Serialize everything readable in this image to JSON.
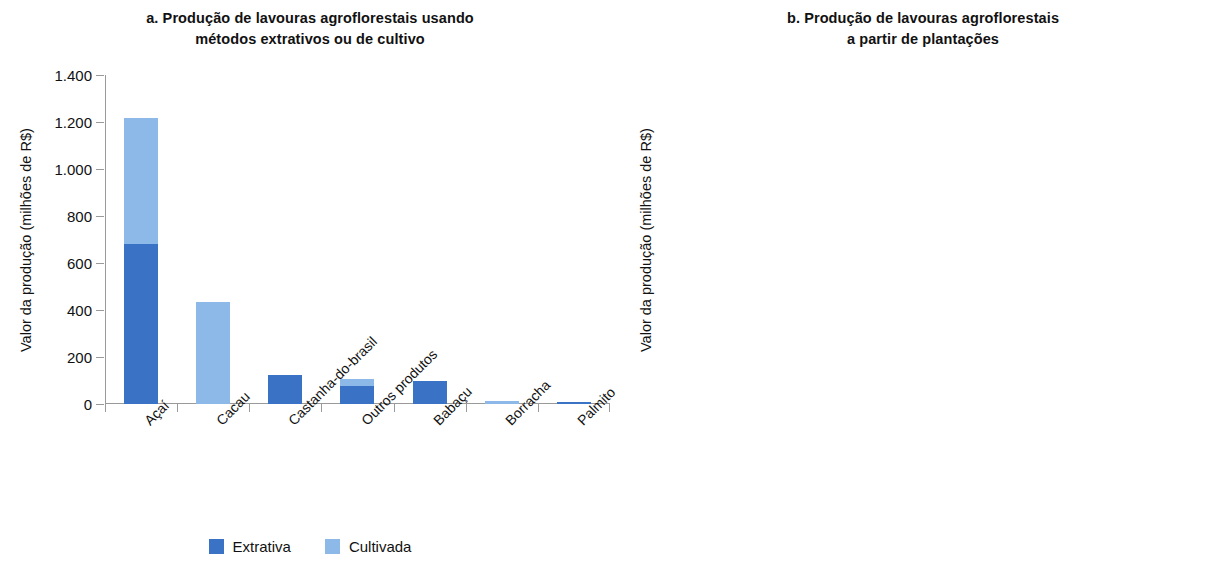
{
  "figure": {
    "legend": {
      "items": [
        {
          "label": "Extrativa",
          "color": "#3a73c5",
          "key": "extrativa"
        },
        {
          "label": "Cultivada",
          "color": "#8cb9e8",
          "key": "cultivada"
        }
      ]
    }
  },
  "panels": {
    "a": {
      "title": "a. Produção de lavouras agroflorestais usando métodos extrativos ou de cultivo",
      "title_line1": "a. Produção de lavouras agroflorestais usando",
      "title_line2": "métodos extrativos ou de cultivo",
      "ylabel": "Valor da produção (milhões de R$)"
    },
    "b": {
      "title": "b. Produção de lavouras agroflorestais a partir de plantações",
      "title_line1": "b. Produção de lavouras agroflorestais",
      "title_line2": "a partir de plantações",
      "ylabel": "Valor da produção (milhões de R$)"
    }
  },
  "chart_data": [
    {
      "id": "a",
      "type": "bar",
      "stacked": true,
      "title": "a. Produção de lavouras agroflorestais usando métodos extrativos ou de cultivo",
      "xlabel": "",
      "ylabel": "Valor da produção (milhões de R$)",
      "ylim": [
        0,
        1400
      ],
      "yticks": [
        0,
        200,
        400,
        600,
        800,
        1000,
        1200,
        1400
      ],
      "ytick_labels": [
        "0",
        "200",
        "400",
        "600",
        "800",
        "1.000",
        "1.200",
        "1.400"
      ],
      "grid": false,
      "legend_position": "bottom-center",
      "categories": [
        "Açaí",
        "Cacau",
        "Castanha-do-brasil",
        "Outros produtos",
        "Babaçu",
        "Borracha",
        "Palmito"
      ],
      "series": [
        {
          "name": "Extrativa",
          "color": "#3a73c5",
          "values": [
            680,
            0,
            125,
            75,
            100,
            0,
            10
          ]
        },
        {
          "name": "Cultivada",
          "color": "#8cb9e8",
          "values": [
            535,
            435,
            0,
            30,
            0,
            12,
            0
          ]
        }
      ],
      "totals": [
        1215,
        435,
        125,
        105,
        100,
        12,
        10
      ]
    },
    {
      "id": "b",
      "type": "bar",
      "stacked": false,
      "title": "b. Produção de lavouras agroflorestais a partir de plantações",
      "xlabel": "",
      "ylabel": "Valor da produção (milhões de R$)",
      "ylim": [
        0,
        400
      ],
      "yticks": [
        0,
        50,
        100,
        150,
        200,
        250,
        300,
        350,
        400
      ],
      "ytick_labels": [
        "0",
        "50",
        "100",
        "150",
        "200",
        "250",
        "300",
        "350",
        "400"
      ],
      "grid": false,
      "legend_position": "none",
      "categories": [
        "Banana",
        "Dendê (Coco)",
        "Café (Canéfora)",
        "Outros produtos",
        "Pimenta-do-reino",
        "Coco",
        "Laranja"
      ],
      "series": [
        {
          "name": "Plantações",
          "color": "#3a73c5",
          "values": [
            380,
            256,
            216,
            210,
            204,
            77,
            48
          ]
        }
      ]
    }
  ]
}
